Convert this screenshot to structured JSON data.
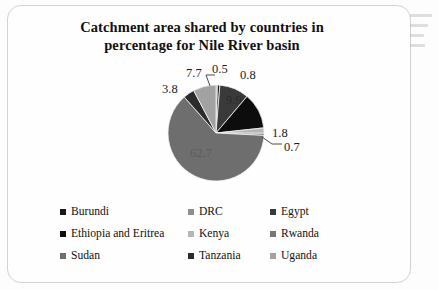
{
  "chart_data": {
    "type": "pie",
    "title": "Catchment  area shared by countries in percentage for Nile River basin",
    "title_line1": "Catchment  area shared by countries in",
    "title_line2": "percentage for Nile River basin",
    "categories": [
      "Burundi",
      "DRC",
      "Egypt",
      "Ethiopia and  Eritrea",
      "Kenya",
      "Rwanda",
      "Sudan",
      "Tanzania",
      "Uganda"
    ],
    "values": [
      0.8,
      0.5,
      9.9,
      12.1,
      1.8,
      0.7,
      62.7,
      3.8,
      7.7
    ],
    "value_labels": [
      "0.8",
      "0.5",
      "9.9",
      "12.1",
      "1.8",
      "0.7",
      "62.7",
      "3.8",
      "7.7"
    ],
    "colors": [
      "#1a1a1a",
      "#8e8e8e",
      "#3a3a3a",
      "#0d0d0d",
      "#b6b6b6",
      "#787878",
      "#6e6e6e",
      "#2b2b2b",
      "#a2a2a2"
    ],
    "units": "percent",
    "legend_position": "bottom",
    "grid": false,
    "xlabel": "",
    "ylabel": ""
  },
  "title": {
    "line1": "Catchment  area shared by countries in",
    "line2": "percentage for Nile River basin"
  },
  "labels": {
    "burundi": "0.8",
    "drc": "0.5",
    "egypt": "9.9",
    "ethiopia": "12.1",
    "kenya": "1.8",
    "rwanda": "0.7",
    "sudan": "62.7",
    "tanzania": "3.8",
    "uganda": "7.7"
  },
  "legend": {
    "items": [
      {
        "label": "Burundi",
        "color": "#1a1a1a"
      },
      {
        "label": "DRC",
        "color": "#8e8e8e"
      },
      {
        "label": "Egypt",
        "color": "#3a3a3a"
      },
      {
        "label": "Ethiopia and  Eritrea",
        "color": "#0d0d0d"
      },
      {
        "label": "Kenya",
        "color": "#b6b6b6"
      },
      {
        "label": "Rwanda",
        "color": "#787878"
      },
      {
        "label": "Sudan",
        "color": "#6e6e6e"
      },
      {
        "label": "Tanzania",
        "color": "#2b2b2b"
      },
      {
        "label": "Uganda",
        "color": "#a2a2a2"
      }
    ]
  }
}
